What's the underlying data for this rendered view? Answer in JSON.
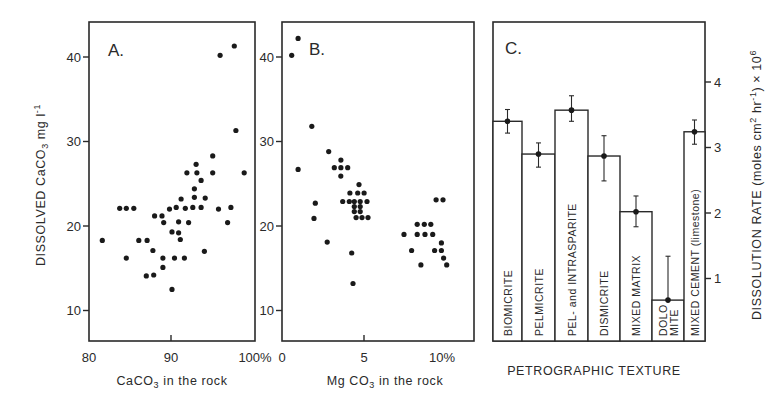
{
  "figure": {
    "panels": [
      {
        "id": "A",
        "label": "A.",
        "xlabel_main": "CaCO",
        "xlabel_sub": "3",
        "xlabel_rest": " in the rock",
        "x_ticks": [
          "80",
          "90",
          "100%"
        ],
        "y_ticks": [
          "10",
          "20",
          "30",
          "40"
        ]
      },
      {
        "id": "B",
        "label": "B.",
        "xlabel_main": "Mg CO",
        "xlabel_sub": "3",
        "xlabel_rest": " in the rock",
        "x_ticks": [
          "0",
          "5",
          "10%"
        ],
        "y_ticks": [
          "10",
          "20",
          "30",
          "40"
        ]
      },
      {
        "id": "C",
        "label": "C.",
        "xlabel": "PETROGRAPHIC TEXTURE",
        "y_ticks": [
          "1",
          "2",
          "3",
          "4"
        ]
      }
    ],
    "shared_ylabel": {
      "part1": "DISSOLVED CaCO",
      "sub": "3",
      "part2": " mg l",
      "sup": "-1"
    },
    "right_ylabel": {
      "text": "DISSOLUTION RATE (moles cm",
      "sup1": "2",
      "mid": " hr",
      "sup2": "-1",
      "end": ") × 10",
      "sup3": "6"
    }
  },
  "chart_data": [
    {
      "type": "scatter",
      "title": "A.",
      "xlabel": "CaCO3 in the rock",
      "ylabel": "DISSOLVED CaCO3 mg l-1",
      "xlim": [
        80,
        100
      ],
      "ylim": [
        6.5,
        44
      ],
      "x_ticks": [
        80,
        90,
        100
      ],
      "y_ticks": [
        10,
        20,
        30,
        40
      ],
      "grid": false,
      "points": [
        [
          81.6,
          18.3
        ],
        [
          83.7,
          22.1
        ],
        [
          84.5,
          22.1
        ],
        [
          85.4,
          22.1
        ],
        [
          84.5,
          16.2
        ],
        [
          86.0,
          18.3
        ],
        [
          87.0,
          18.3
        ],
        [
          87.7,
          17.1
        ],
        [
          86.9,
          14.1
        ],
        [
          87.8,
          14.2
        ],
        [
          87.9,
          21.2
        ],
        [
          88.8,
          21.2
        ],
        [
          89.0,
          20.4
        ],
        [
          88.9,
          16.2
        ],
        [
          88.9,
          15.1
        ],
        [
          90.0,
          12.5
        ],
        [
          89.7,
          22.0
        ],
        [
          90.5,
          22.2
        ],
        [
          90.0,
          19.3
        ],
        [
          90.8,
          19.2
        ],
        [
          91.0,
          18.4
        ],
        [
          90.8,
          20.5
        ],
        [
          90.3,
          16.2
        ],
        [
          91.5,
          16.2
        ],
        [
          92.0,
          20.4
        ],
        [
          91.6,
          22.1
        ],
        [
          92.5,
          22.2
        ],
        [
          93.5,
          22.2
        ],
        [
          93.9,
          17.0
        ],
        [
          95.6,
          22.0
        ],
        [
          97.1,
          22.2
        ],
        [
          96.7,
          20.4
        ],
        [
          91.1,
          23.2
        ],
        [
          92.7,
          23.4
        ],
        [
          94.0,
          23.3
        ],
        [
          92.7,
          24.4
        ],
        [
          93.5,
          25.4
        ],
        [
          91.8,
          26.3
        ],
        [
          93.0,
          26.3
        ],
        [
          94.9,
          26.3
        ],
        [
          92.9,
          27.3
        ],
        [
          94.9,
          28.3
        ],
        [
          98.7,
          26.3
        ],
        [
          97.7,
          31.3
        ],
        [
          95.8,
          40.2
        ],
        [
          97.5,
          41.3
        ]
      ]
    },
    {
      "type": "scatter",
      "title": "B.",
      "xlabel": "MgCO3 in the rock",
      "ylabel": "DISSOLVED CaCO3 mg l-1",
      "xlim": [
        0,
        12
      ],
      "ylim": [
        6.5,
        44
      ],
      "x_ticks": [
        0,
        5,
        10
      ],
      "y_ticks": [
        10,
        20,
        30,
        40
      ],
      "grid": false,
      "points": [
        [
          0.6,
          40.2
        ],
        [
          1.0,
          42.2
        ],
        [
          1.0,
          26.7
        ],
        [
          1.85,
          31.8
        ],
        [
          2.9,
          28.8
        ],
        [
          3.25,
          26.9
        ],
        [
          3.66,
          26.9
        ],
        [
          4.08,
          26.9
        ],
        [
          3.66,
          27.8
        ],
        [
          3.65,
          25.9
        ],
        [
          4.78,
          24.9
        ],
        [
          4.22,
          23.9
        ],
        [
          4.7,
          23.9
        ],
        [
          5.1,
          23.9
        ],
        [
          3.77,
          22.9
        ],
        [
          4.18,
          22.9
        ],
        [
          4.49,
          22.9
        ],
        [
          4.86,
          22.9
        ],
        [
          5.28,
          22.9
        ],
        [
          4.49,
          22.3
        ],
        [
          4.86,
          22.3
        ],
        [
          4.49,
          21.7
        ],
        [
          4.86,
          21.7
        ],
        [
          4.6,
          21.0
        ],
        [
          4.97,
          21.0
        ],
        [
          5.34,
          21.0
        ],
        [
          2.07,
          22.7
        ],
        [
          1.99,
          20.9
        ],
        [
          2.81,
          18.1
        ],
        [
          4.33,
          16.8
        ],
        [
          4.41,
          13.2
        ],
        [
          9.57,
          23.1
        ],
        [
          10.0,
          23.1
        ],
        [
          8.4,
          20.2
        ],
        [
          8.84,
          20.2
        ],
        [
          9.24,
          20.2
        ],
        [
          7.58,
          19.0
        ],
        [
          8.4,
          19.0
        ],
        [
          8.88,
          19.0
        ],
        [
          9.36,
          19.0
        ],
        [
          9.9,
          18.0
        ],
        [
          8.05,
          17.1
        ],
        [
          9.48,
          17.1
        ],
        [
          9.9,
          17.1
        ],
        [
          10.04,
          16.2
        ],
        [
          8.63,
          15.4
        ],
        [
          10.23,
          15.4
        ]
      ]
    },
    {
      "type": "bar",
      "title": "C.",
      "xlabel": "PETROGRAPHIC TEXTURE",
      "ylabel": "DISSOLUTION RATE (moles cm2 hr-1) x 10^6",
      "ylim": [
        0,
        4.9
      ],
      "y_ticks": [
        1,
        2,
        3,
        4
      ],
      "y_axis_side": "right",
      "categories": [
        "BIOMICRITE",
        "PELMICRITE",
        "PEL- and INTRASPARITE",
        "DISMICRITE",
        "MIXED MATRIX",
        "DOLOMITE",
        "MIXED CEMENT (limestone)"
      ],
      "bar_labels": [
        [
          "BIOMICRITE"
        ],
        [
          "PELMICRITE"
        ],
        [
          "PEL- and INTRASPARITE"
        ],
        [
          "DISMICRITE"
        ],
        [
          "MIXED MATRIX"
        ],
        [
          "DOLO",
          "MITE"
        ],
        [
          "MIXED CEMENT (limestone)"
        ]
      ],
      "values": [
        3.4,
        2.9,
        3.57,
        2.87,
        2.02,
        0.67,
        3.24
      ],
      "error_high": [
        3.58,
        3.07,
        3.79,
        3.18,
        2.26,
        1.34,
        3.42
      ],
      "error_low": [
        3.22,
        2.7,
        3.4,
        2.49,
        1.79,
        null,
        3.05
      ]
    }
  ]
}
